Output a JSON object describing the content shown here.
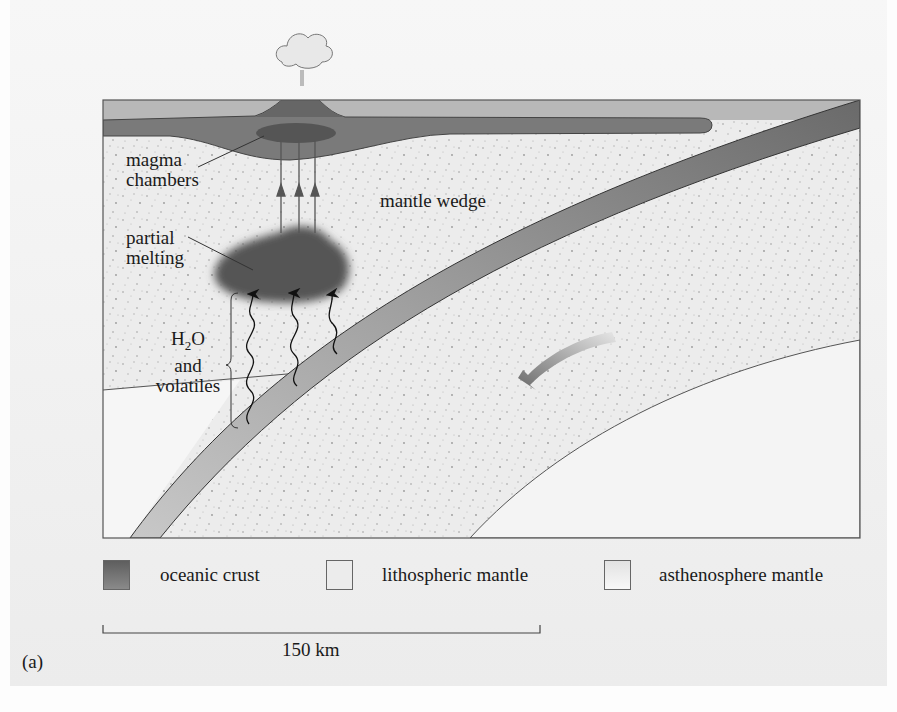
{
  "figure": {
    "panel_label": "(a)",
    "labels": {
      "magma_chambers_line1": "magma",
      "magma_chambers_line2": "chambers",
      "mantle_wedge": "mantle wedge",
      "partial_melting_line1": "partial",
      "partial_melting_line2": "melting",
      "h2o_line1": "H",
      "h2o_sub": "2",
      "h2o_line1_end": "O",
      "h2o_line2": "and",
      "h2o_line3": "volatiles"
    },
    "legend": [
      {
        "label": "oceanic crust",
        "swatch": "#6f6f6f"
      },
      {
        "label": "lithospheric mantle",
        "swatch": "#ededed"
      },
      {
        "label": "asthenosphere mantle",
        "swatch": "#f3f3f3"
      }
    ],
    "scale_bar": {
      "label": "150 km"
    },
    "colors": {
      "crust": "#707070",
      "crust_light": "#9a9a9a",
      "lithosphere": "#ebebeb",
      "asthenosphere": "#f4f4f4",
      "melt": "#555555"
    }
  }
}
